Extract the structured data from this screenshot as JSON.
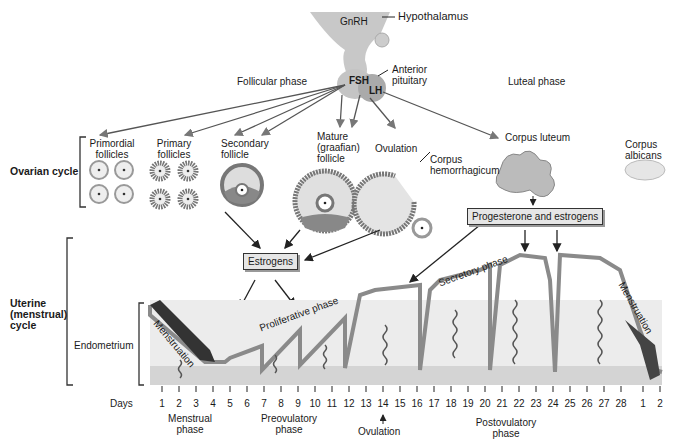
{
  "hormones": {
    "gnrh": "GnRH",
    "fsh": "FSH",
    "lh": "LH"
  },
  "structures": {
    "hypothalamus": "Hypothalamus",
    "anterior_pituitary_1": "Anterior",
    "anterior_pituitary_2": "pituitary"
  },
  "phases": {
    "follicular": "Follicular phase",
    "luteal": "Luteal phase"
  },
  "ovarian": {
    "title": "Ovarian cycle",
    "stages": [
      {
        "l1": "Primordial",
        "l2": "follicles"
      },
      {
        "l1": "Primary",
        "l2": "follicles"
      },
      {
        "l1": "Secondary",
        "l2": "follicle"
      },
      {
        "l1": "Mature",
        "l2": "(graafian)",
        "l3": "follicle"
      },
      {
        "l1": "Ovulation"
      },
      {
        "l1": "Corpus",
        "l2": "hemorrhagicum"
      },
      {
        "l1": "Corpus luteum"
      },
      {
        "l1": "Corpus",
        "l2": "albicans"
      }
    ]
  },
  "boxes": {
    "estrogens": "Estrogens",
    "progesterone": "Progesterone and estrogens"
  },
  "uterine": {
    "title_1": "Uterine",
    "title_2": "(menstrual)",
    "title_3": "cycle",
    "endometrium": "Endometrium",
    "menstruation_start": "Menstruation",
    "proliferative": "Proliferative phase",
    "secretory": "Secretory phase",
    "menstruation_end": "Menstruation"
  },
  "timeline": {
    "label": "Days",
    "days": [
      "1",
      "2",
      "3",
      "4",
      "5",
      "6",
      "7",
      "8",
      "9",
      "10",
      "11",
      "12",
      "13",
      "14",
      "15",
      "16",
      "17",
      "18",
      "19",
      "20",
      "21",
      "22",
      "23",
      "24",
      "25",
      "26",
      "27",
      "28",
      "1",
      "2"
    ],
    "menstrual_1": "Menstrual",
    "menstrual_2": "phase",
    "preovulatory_1": "Preovulatory",
    "preovulatory_2": "phase",
    "ovulation": "Ovulation",
    "postovulatory_1": "Postovulatory",
    "postovulatory_2": "phase"
  }
}
